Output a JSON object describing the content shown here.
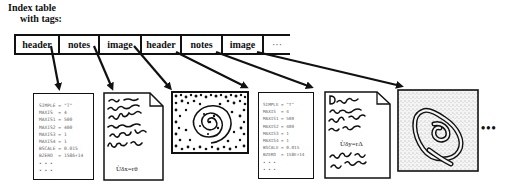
{
  "title": {
    "line1": "Index table",
    "line2": "with tags:"
  },
  "index_table": {
    "cells": [
      {
        "label": "header",
        "width": 44
      },
      {
        "label": "notes",
        "width": 40
      },
      {
        "label": "image",
        "width": 42
      },
      {
        "label": "header",
        "width": 40
      },
      {
        "label": "notes",
        "width": 41
      },
      {
        "label": "image",
        "width": 41
      },
      {
        "label": "···",
        "width": 26
      }
    ]
  },
  "documents": [
    {
      "type": "header",
      "lines": [
        "SIMPLE = \"T\"",
        "MAXIS  = 4",
        "MAXIS1 = 500",
        "MAXIS2 = 400",
        "MAXIS3 = 1",
        "MAXIS4 = 1",
        "BSCALE = 0.015",
        "BZERO  = 1586+14",
        "• • •",
        "• • •"
      ]
    },
    {
      "type": "notes",
      "equation": "Ùδx=rθ"
    },
    {
      "type": "image",
      "description": "dotted spiral"
    },
    {
      "type": "header",
      "lines": [
        "SIMPLE = \"T\"",
        "MAXIS  = 4",
        "MAXIS1 = 500",
        "MAXIS2 = 400",
        "MAXIS3 = 1",
        "MAXIS4 = 1",
        "BSCALE = 0.015",
        "BZERO  = 158E+14",
        "• • •",
        "• • •"
      ]
    },
    {
      "type": "notes",
      "equation": "Ùδy=rΔ"
    },
    {
      "type": "image",
      "description": "stippled contour spiral"
    }
  ],
  "trailing_ellipsis": "•••"
}
